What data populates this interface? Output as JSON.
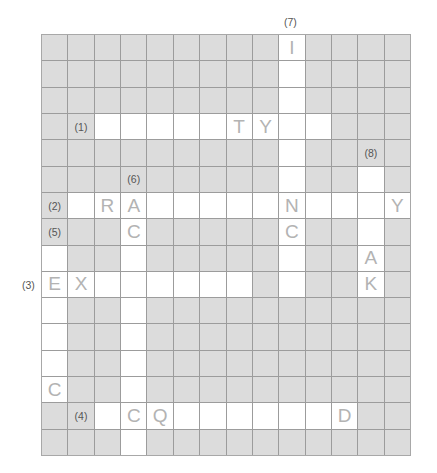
{
  "puzzle": {
    "cols": 14,
    "rows": 16,
    "colors": {
      "blocked": "#dcdcdc",
      "open": "#ffffff",
      "grid_line": "#9c9c9c",
      "letter": "#b3b3b3",
      "label": "#555555"
    },
    "open_cells": [
      [
        0,
        9
      ],
      [
        1,
        9
      ],
      [
        2,
        9
      ],
      [
        3,
        2
      ],
      [
        3,
        3
      ],
      [
        3,
        4
      ],
      [
        3,
        5
      ],
      [
        3,
        6
      ],
      [
        3,
        7
      ],
      [
        3,
        8
      ],
      [
        3,
        9
      ],
      [
        3,
        10
      ],
      [
        4,
        9
      ],
      [
        5,
        9
      ],
      [
        5,
        12
      ],
      [
        6,
        1
      ],
      [
        6,
        2
      ],
      [
        6,
        3
      ],
      [
        6,
        4
      ],
      [
        6,
        5
      ],
      [
        6,
        6
      ],
      [
        6,
        7
      ],
      [
        6,
        8
      ],
      [
        6,
        9
      ],
      [
        6,
        10
      ],
      [
        6,
        11
      ],
      [
        6,
        12
      ],
      [
        6,
        13
      ],
      [
        7,
        3
      ],
      [
        7,
        9
      ],
      [
        7,
        12
      ],
      [
        8,
        0
      ],
      [
        8,
        3
      ],
      [
        8,
        9
      ],
      [
        8,
        12
      ],
      [
        9,
        0
      ],
      [
        9,
        1
      ],
      [
        9,
        2
      ],
      [
        9,
        3
      ],
      [
        9,
        4
      ],
      [
        9,
        5
      ],
      [
        9,
        6
      ],
      [
        9,
        7
      ],
      [
        9,
        9
      ],
      [
        9,
        12
      ],
      [
        10,
        0
      ],
      [
        10,
        3
      ],
      [
        11,
        0
      ],
      [
        11,
        3
      ],
      [
        12,
        0
      ],
      [
        12,
        3
      ],
      [
        13,
        0
      ],
      [
        13,
        3
      ],
      [
        14,
        2
      ],
      [
        14,
        3
      ],
      [
        14,
        4
      ],
      [
        14,
        5
      ],
      [
        14,
        6
      ],
      [
        14,
        7
      ],
      [
        14,
        8
      ],
      [
        14,
        9
      ],
      [
        14,
        10
      ],
      [
        14,
        11
      ],
      [
        15,
        3
      ]
    ],
    "letters": [
      {
        "r": 0,
        "c": 9,
        "ch": "I"
      },
      {
        "r": 3,
        "c": 7,
        "ch": "T"
      },
      {
        "r": 3,
        "c": 8,
        "ch": "Y"
      },
      {
        "r": 6,
        "c": 2,
        "ch": "R"
      },
      {
        "r": 6,
        "c": 3,
        "ch": "A"
      },
      {
        "r": 6,
        "c": 9,
        "ch": "N"
      },
      {
        "r": 6,
        "c": 13,
        "ch": "Y"
      },
      {
        "r": 7,
        "c": 3,
        "ch": "C"
      },
      {
        "r": 7,
        "c": 9,
        "ch": "C"
      },
      {
        "r": 8,
        "c": 12,
        "ch": "A"
      },
      {
        "r": 9,
        "c": 0,
        "ch": "E"
      },
      {
        "r": 9,
        "c": 1,
        "ch": "X"
      },
      {
        "r": 9,
        "c": 12,
        "ch": "K"
      },
      {
        "r": 13,
        "c": 0,
        "ch": "C"
      },
      {
        "r": 14,
        "c": 3,
        "ch": "C"
      },
      {
        "r": 14,
        "c": 4,
        "ch": "Q"
      },
      {
        "r": 14,
        "c": 11,
        "ch": "D"
      }
    ],
    "cell_labels": [
      {
        "r": 3,
        "c": 1,
        "text": "(1)"
      },
      {
        "r": 4,
        "c": 12,
        "text": "(8)"
      },
      {
        "r": 5,
        "c": 3,
        "text": "(6)"
      },
      {
        "r": 6,
        "c": 0,
        "text": "(2)"
      },
      {
        "r": 7,
        "c": 0,
        "text": "(5)"
      },
      {
        "r": 14,
        "c": 1,
        "text": "(4)"
      }
    ],
    "outer_labels": [
      {
        "text": "(7)",
        "x": 284,
        "y": 16
      },
      {
        "text": "(3)",
        "x": 22,
        "y": 279
      }
    ]
  }
}
